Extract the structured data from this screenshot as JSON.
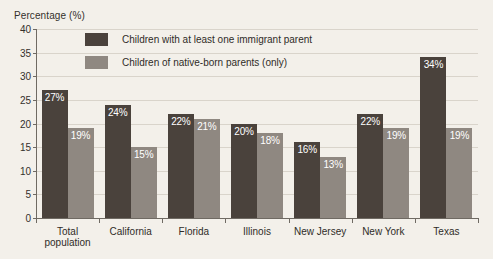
{
  "chart_data": {
    "type": "bar",
    "title": "",
    "xlabel": "",
    "ylabel": "Percentage (%)",
    "ylim": [
      0,
      40
    ],
    "yticks": [
      0,
      5,
      10,
      15,
      20,
      25,
      30,
      35,
      40
    ],
    "grid": true,
    "legend_position": "inside-top-left",
    "categories": [
      "Total population",
      "California",
      "Florida",
      "Illinois",
      "New Jersey",
      "New York",
      "Texas"
    ],
    "series": [
      {
        "name": "Children with at least one immigrant parent",
        "color": "#4a423c",
        "values": [
          27,
          24,
          22,
          20,
          16,
          22,
          34
        ],
        "labels": [
          "27%",
          "24%",
          "22%",
          "20%",
          "16%",
          "22%",
          "34%"
        ]
      },
      {
        "name": "Children of native-born parents (only)",
        "color": "#8f8881",
        "values": [
          19,
          15,
          21,
          18,
          13,
          19,
          19
        ],
        "labels": [
          "19%",
          "15%",
          "21%",
          "18%",
          "13%",
          "19%",
          "19%"
        ]
      }
    ]
  },
  "axis": {
    "y_title": "Percentage (%)",
    "tick_labels": [
      "40",
      "35",
      "30",
      "25",
      "20",
      "15",
      "10",
      "5",
      "0"
    ]
  },
  "categories": [
    {
      "line1": "Total",
      "line2": "population"
    },
    {
      "line1": "California",
      "line2": ""
    },
    {
      "line1": "Florida",
      "line2": ""
    },
    {
      "line1": "Illinois",
      "line2": ""
    },
    {
      "line1": "New Jersey",
      "line2": ""
    },
    {
      "line1": "New York",
      "line2": ""
    },
    {
      "line1": "Texas",
      "line2": ""
    }
  ],
  "legend": {
    "items": [
      {
        "label": "Children with at least one immigrant parent",
        "color": "#4a423c"
      },
      {
        "label": "Children of native-born parents (only)",
        "color": "#8f8881"
      }
    ]
  },
  "colors": {
    "background": "#f3f0ea",
    "immigrant_parent_bar": "#4a423c",
    "native_born_bar": "#8f8881",
    "gridline": "#d9d4cb",
    "axis": "#6f6a63",
    "bar_label_text": "#ffffff"
  }
}
